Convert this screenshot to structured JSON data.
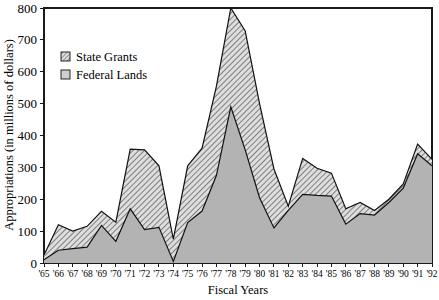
{
  "chart_data": {
    "type": "area",
    "subtype": "stacked-area",
    "title": "",
    "xlabel": "Fiscal Years",
    "ylabel": "Appropriations (in millions of dollars)",
    "xlim": [
      1965,
      1992
    ],
    "ylim": [
      0,
      800
    ],
    "grid": false,
    "legend_position": "upper-left-inside",
    "ytick_labels": [
      "0",
      "100",
      "200",
      "300",
      "400",
      "500",
      "600",
      "700",
      "800"
    ],
    "ytick_values": [
      0,
      100,
      200,
      300,
      400,
      500,
      600,
      700,
      800
    ],
    "categories": [
      "'65",
      "'66",
      "'67",
      "'68",
      "'69",
      "'70",
      "'71",
      "'72",
      "'73",
      "'74",
      "'75",
      "'76",
      "'77",
      "'78",
      "'79",
      "'80",
      "'81",
      "'82",
      "'83",
      "'84",
      "'85",
      "'86",
      "'87",
      "'88",
      "'89",
      "'90",
      "'91",
      "'92"
    ],
    "x": [
      1965,
      1966,
      1967,
      1968,
      1969,
      1970,
      1971,
      1972,
      1973,
      1974,
      1975,
      1976,
      1977,
      1978,
      1979,
      1980,
      1981,
      1982,
      1983,
      1984,
      1985,
      1986,
      1987,
      1988,
      1989,
      1990,
      1991,
      1992
    ],
    "series": [
      {
        "name": "Federal Lands",
        "fill": "#b3b3b3",
        "pattern": "solid-gray",
        "values": [
          10,
          40,
          45,
          50,
          118,
          68,
          170,
          105,
          112,
          5,
          127,
          163,
          275,
          490,
          355,
          205,
          110,
          165,
          215,
          212,
          210,
          122,
          155,
          150,
          190,
          235,
          343,
          305
        ]
      },
      {
        "name": "State Grants",
        "fill": "#d8d8d8",
        "pattern": "diagonal-hatch",
        "values": [
          15,
          80,
          55,
          65,
          44,
          60,
          187,
          250,
          193,
          70,
          178,
          197,
          280,
          310,
          373,
          295,
          185,
          13,
          113,
          85,
          72,
          48,
          35,
          15,
          10,
          13,
          30,
          20
        ]
      }
    ],
    "totals": [
      25,
      120,
      100,
      115,
      162,
      128,
      357,
      355,
      305,
      75,
      305,
      360,
      555,
      800,
      728,
      500,
      295,
      178,
      328,
      297,
      282,
      170,
      190,
      165,
      200,
      248,
      373,
      325
    ],
    "annotations": []
  },
  "legend": {
    "entries": [
      {
        "label": "State Grants",
        "swatch": "hatched-square"
      },
      {
        "label": "Federal Lands",
        "swatch": "gray-square"
      }
    ]
  },
  "colors": {
    "federal_lands_fill": "#b3b3b3",
    "state_grants_fill": "#d8d8d8",
    "outline": "#111111",
    "axis": "#1a1a1a",
    "background": "#ffffff"
  }
}
